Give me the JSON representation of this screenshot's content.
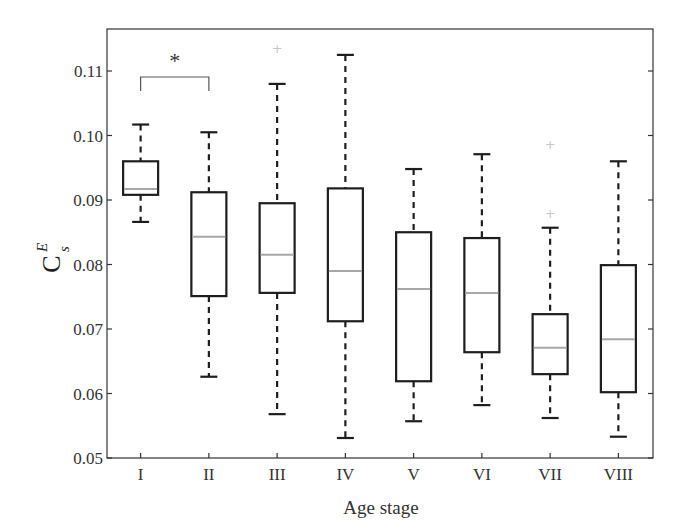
{
  "chart_data": {
    "type": "box",
    "title": "",
    "xlabel": "Age stage",
    "ylabel": "C_S^E",
    "ylabel_parts": {
      "base": "C",
      "superscript": "E",
      "subscript": "S"
    },
    "ylim": [
      0.05,
      0.116
    ],
    "yticks": [
      0.05,
      0.06,
      0.07,
      0.08,
      0.09,
      0.1,
      0.11
    ],
    "ytick_labels": [
      "0.05",
      "0.06",
      "0.07",
      "0.08",
      "0.09",
      "0.10",
      "0.11"
    ],
    "categories": [
      "I",
      "II",
      "III",
      "IV",
      "V",
      "VI",
      "VII",
      "VIII"
    ],
    "boxes": [
      {
        "label": "I",
        "whisker_low": 0.0866,
        "q1": 0.0908,
        "median": 0.0917,
        "q3": 0.096,
        "whisker_high": 0.1017,
        "outliers": []
      },
      {
        "label": "II",
        "whisker_low": 0.0626,
        "q1": 0.0751,
        "median": 0.0843,
        "q3": 0.0912,
        "whisker_high": 0.1005,
        "outliers": []
      },
      {
        "label": "III",
        "whisker_low": 0.0568,
        "q1": 0.0756,
        "median": 0.0815,
        "q3": 0.0895,
        "whisker_high": 0.108,
        "outliers": [
          0.1136
        ]
      },
      {
        "label": "IV",
        "whisker_low": 0.0531,
        "q1": 0.0712,
        "median": 0.079,
        "q3": 0.0918,
        "whisker_high": 0.1125,
        "outliers": []
      },
      {
        "label": "V",
        "whisker_low": 0.0557,
        "q1": 0.0619,
        "median": 0.0762,
        "q3": 0.085,
        "whisker_high": 0.0948,
        "outliers": []
      },
      {
        "label": "VI",
        "whisker_low": 0.0582,
        "q1": 0.0664,
        "median": 0.0756,
        "q3": 0.0841,
        "whisker_high": 0.0971,
        "outliers": []
      },
      {
        "label": "VII",
        "whisker_low": 0.0562,
        "q1": 0.063,
        "median": 0.0671,
        "q3": 0.0723,
        "whisker_high": 0.0857,
        "outliers": [
          0.088,
          0.0987
        ]
      },
      {
        "label": "VIII",
        "whisker_low": 0.0533,
        "q1": 0.0602,
        "median": 0.0684,
        "q3": 0.0799,
        "whisker_high": 0.096,
        "outliers": []
      }
    ],
    "annotations": [
      {
        "type": "significance-bracket",
        "from": "I",
        "to": "II",
        "text": "*"
      }
    ],
    "grid": false,
    "legend": null,
    "colors": {
      "box": "#1e1e1e",
      "median": "#a8a8a8",
      "whisker": "#1e1e1e",
      "outlier": "#c8c8c8",
      "axis": "#333333"
    }
  }
}
